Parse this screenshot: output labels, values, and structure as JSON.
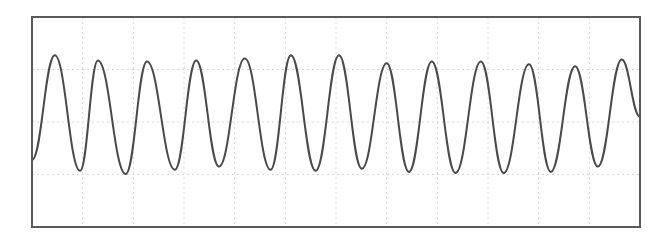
{
  "chart_data": {
    "type": "line",
    "title": "",
    "xlabel": "",
    "ylabel": "",
    "grid": true,
    "grid_divisions": {
      "x": 12,
      "y": 4
    },
    "legend": null,
    "xlim": [
      0,
      12
    ],
    "ylim": [
      -2,
      2
    ],
    "peaks": [
      {
        "x": 0.45,
        "y": 1.27
      },
      {
        "x": 1.3,
        "y": 1.17
      },
      {
        "x": 2.27,
        "y": 1.15
      },
      {
        "x": 3.24,
        "y": 1.17
      },
      {
        "x": 4.2,
        "y": 1.21
      },
      {
        "x": 5.11,
        "y": 1.27
      },
      {
        "x": 6.06,
        "y": 1.27
      },
      {
        "x": 7.0,
        "y": 1.12
      },
      {
        "x": 7.89,
        "y": 1.15
      },
      {
        "x": 8.86,
        "y": 1.15
      },
      {
        "x": 9.81,
        "y": 1.1
      },
      {
        "x": 10.72,
        "y": 1.06
      },
      {
        "x": 11.64,
        "y": 1.19
      }
    ],
    "troughs": [
      {
        "x": 0.95,
        "y": -0.93
      },
      {
        "x": 1.85,
        "y": -0.99
      },
      {
        "x": 2.82,
        "y": -0.91
      },
      {
        "x": 3.69,
        "y": -0.85
      },
      {
        "x": 4.71,
        "y": -0.91
      },
      {
        "x": 5.6,
        "y": -0.93
      },
      {
        "x": 6.51,
        "y": -0.89
      },
      {
        "x": 7.44,
        "y": -0.95
      },
      {
        "x": 8.36,
        "y": -0.97
      },
      {
        "x": 9.31,
        "y": -0.97
      },
      {
        "x": 10.24,
        "y": -0.95
      },
      {
        "x": 11.17,
        "y": -0.85
      }
    ],
    "start": {
      "x": 0.0,
      "y": -0.72
    },
    "end": {
      "x": 12.0,
      "y": 0.1
    }
  },
  "style": {
    "line_color": "#4a4a4a",
    "frame_color": "#5a5a5a",
    "grid_color": "#d8d8d8",
    "background": "#ffffff"
  }
}
